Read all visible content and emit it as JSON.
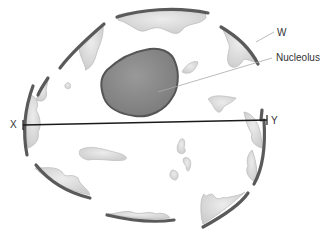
{
  "diagram": {
    "labels": {
      "w": "W",
      "nucleolus": "Nucleolus",
      "x": "X",
      "y": "Y"
    },
    "colors": {
      "envelope": "#5a5a5a",
      "chromatin_fill": "#d9d9d9",
      "chromatin_stroke": "#bdbdbd",
      "nucleolus_fill": "#8c8c8c",
      "nucleolus_stroke": "#555555",
      "line": "#1a1a1a",
      "pointer": "#aaaaaa",
      "background": "#ffffff"
    }
  }
}
